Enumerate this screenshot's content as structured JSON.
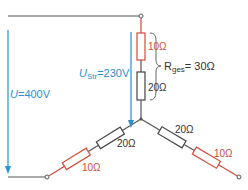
{
  "colors": {
    "wire": "#555555",
    "red": "#d24a3a",
    "blue": "#2a8fce",
    "dark": "#333333"
  },
  "voltages": {
    "line": {
      "symbol": "U",
      "value": "=400V"
    },
    "phase": {
      "symbol": "U",
      "subscript": "Str",
      "value": "=230V"
    }
  },
  "total_resistance": {
    "symbol": "R",
    "subscript": "ges",
    "value": "= 30Ω"
  },
  "resistors": {
    "top_red": "10Ω",
    "top_black": "20Ω",
    "left_black": "20Ω",
    "left_red": "10Ω",
    "right_black": "20Ω",
    "right_red": "10Ω"
  }
}
